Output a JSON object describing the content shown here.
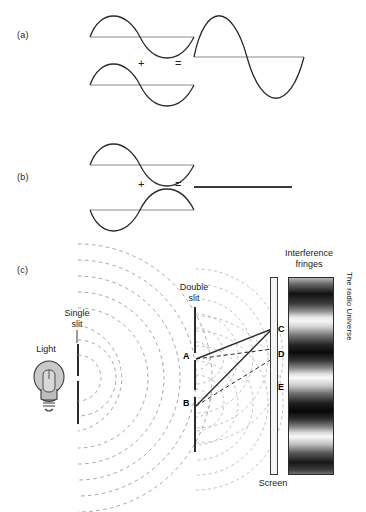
{
  "figure": {
    "panels": [
      {
        "id": "a",
        "label": "(a)",
        "plus": "+",
        "equals": "=",
        "description": "constructive interference"
      },
      {
        "id": "b",
        "label": "(b)",
        "plus": "+",
        "equals": "=",
        "description": "destructive interference"
      },
      {
        "id": "c",
        "label": "(c)",
        "description": "double slit experiment"
      }
    ],
    "labels": {
      "light": "Light",
      "single_slit": "Single\nslit",
      "double_slit": "Double\nslit",
      "interference_fringes": "Interference\nfringes",
      "screen": "Screen",
      "side_text": "The radio Universe"
    },
    "points": {
      "a": "A",
      "b": "B",
      "c": "C",
      "d": "D",
      "e": "E"
    },
    "colors": {
      "ink": "#1a1a1a",
      "stroke": "#2b2b2b",
      "wavefront": "#9a9a9a",
      "bulb_fill": "#c9c9c9",
      "baseline": "#8a8a8a"
    }
  }
}
